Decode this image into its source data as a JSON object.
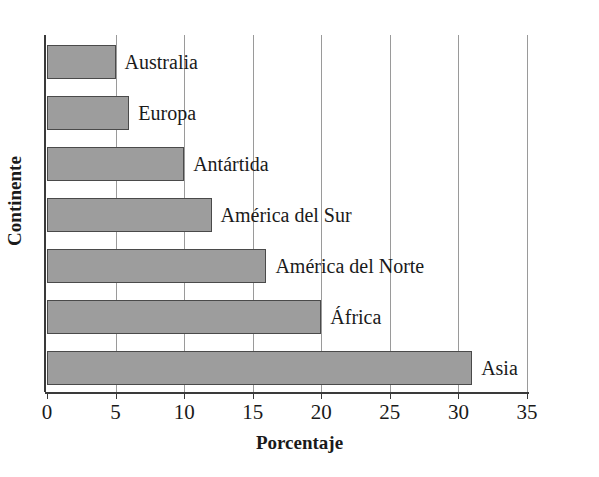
{
  "chart_data": {
    "type": "bar",
    "orientation": "horizontal",
    "title": "",
    "xlabel": "Porcentaje",
    "ylabel": "Continente",
    "categories": [
      "Asia",
      "África",
      "América del Norte",
      "América del Sur",
      "Antártida",
      "Europa",
      "Australia"
    ],
    "values": [
      31,
      20,
      16,
      12,
      10,
      6,
      5
    ],
    "xlim": [
      0,
      35
    ],
    "xticks": [
      0,
      5,
      10,
      15,
      20,
      25,
      30,
      35
    ],
    "xtick_labels": [
      "0",
      "5",
      "10",
      "15",
      "20",
      "25",
      "30",
      "35"
    ],
    "grid": "vertical",
    "legend": "none",
    "bar_color": "#9d9d9d",
    "bar_edge_color": "#4a4a4a",
    "axis_color": "#3a3a3a",
    "gridline_color": "#9a9a9a",
    "bars": [
      {
        "label": "Australia",
        "value": 5
      },
      {
        "label": "Europa",
        "value": 6
      },
      {
        "label": "Antártida",
        "value": 10
      },
      {
        "label": "América del Sur",
        "value": 12
      },
      {
        "label": "América del Norte",
        "value": 16
      },
      {
        "label": "África",
        "value": 20
      },
      {
        "label": "Asia",
        "value": 31
      }
    ]
  }
}
